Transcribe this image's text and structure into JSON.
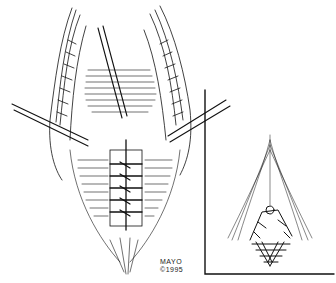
{
  "figure": {
    "type": "surgical line illustration",
    "main_view": "anatomical dissection with retracted muscle layers and sutured midline closure",
    "inset_view": "close-up of sutured tissue at apex",
    "credit": {
      "line1": "MAYO",
      "line2": "©1995"
    },
    "colors": {
      "ink": "#111111",
      "background": "#ffffff"
    }
  }
}
